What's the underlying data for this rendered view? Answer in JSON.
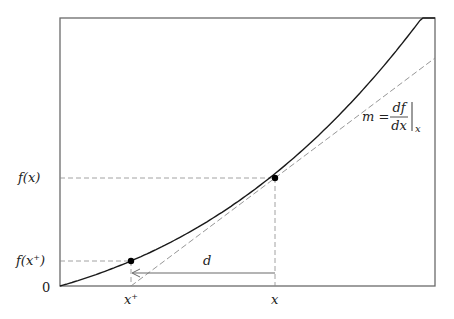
{
  "diagram": {
    "title": "",
    "frame": {
      "left": 60,
      "top": 18,
      "right": 435,
      "bottom": 286,
      "color": "#6a6a6a"
    },
    "curve": {
      "color": "#1a1a1a",
      "start": [
        60,
        286
      ],
      "end": [
        435,
        18
      ],
      "passes_through": [
        [
          131,
          261
        ],
        [
          275,
          178
        ]
      ]
    },
    "tangent": {
      "color": "#8a8a8a",
      "from": [
        131,
        286
      ],
      "to": [
        435,
        58
      ],
      "slope_label": "m = df/dx |x"
    },
    "points": [
      {
        "name": "x",
        "px": [
          275,
          178
        ]
      },
      {
        "name": "x+",
        "px": [
          131,
          261
        ]
      }
    ],
    "labels": {
      "y_fx": "f(x)",
      "y_fxplus_prefix": "f(x",
      "y_fxplus_sup": "+",
      "y_fxplus_suffix": ")",
      "origin": "0",
      "x_plus": "x",
      "x_plus_sup": "+",
      "x": "x",
      "distance": "d",
      "slope_m": "m =",
      "slope_num": "df",
      "slope_den": "dx",
      "slope_sub": "x"
    },
    "arrow": {
      "from": [
        275,
        273
      ],
      "to": [
        131,
        273
      ],
      "label": "d"
    }
  }
}
